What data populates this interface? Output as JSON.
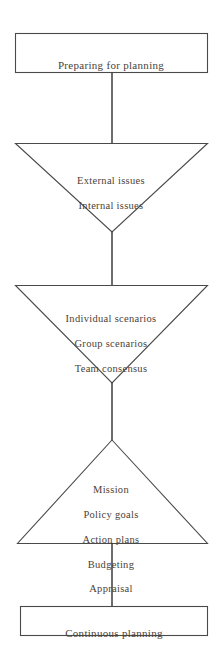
{
  "diagram": {
    "type": "vertical-flowchart",
    "orientation": "top-to-bottom",
    "stroke_color": "#4a4a4a",
    "text_color": "#4b4239",
    "background_color": "#ffffff",
    "nodes": [
      {
        "id": "node-preparing",
        "shape": "rectangle",
        "label": "Preparing for planning",
        "lines": [
          "Preparing for planning"
        ]
      },
      {
        "id": "node-issues",
        "shape": "triangle-down",
        "label": "External issues Internal issues",
        "lines": [
          "External issues",
          "Internal issues"
        ]
      },
      {
        "id": "node-scenarios",
        "shape": "triangle-down",
        "label": "Individual scenarios Group scenarios Team consensus",
        "lines": [
          "Individual scenarios",
          "Group scenarios",
          "Team consensus"
        ]
      },
      {
        "id": "node-mission",
        "shape": "triangle-up",
        "label": "Mission Policy goals Action plans Budgeting Appraisal",
        "lines": [
          "Mission",
          "Policy goals",
          "Action plans",
          "Budgeting",
          "Appraisal"
        ]
      },
      {
        "id": "node-continuous",
        "shape": "rectangle",
        "label": "Continuous planning",
        "lines": [
          "Continuous planning"
        ]
      }
    ],
    "connectors": [
      {
        "id": "connector-1",
        "from": "node-preparing",
        "to": "node-issues"
      },
      {
        "id": "connector-2",
        "from": "node-issues",
        "to": "node-scenarios"
      },
      {
        "id": "connector-3",
        "from": "node-scenarios",
        "to": "node-mission"
      },
      {
        "id": "connector-4",
        "from": "node-mission",
        "to": "node-continuous"
      }
    ]
  }
}
